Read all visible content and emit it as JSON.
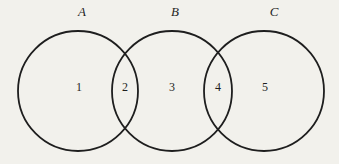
{
  "venn": {
    "set_labels": [
      "A",
      "B",
      "C"
    ],
    "region_labels": [
      "1",
      "2",
      "3",
      "4",
      "5"
    ]
  },
  "colors": {
    "background": "#f2f1ec",
    "stroke": "#1e1e1e",
    "text": "#1f1f1f"
  }
}
